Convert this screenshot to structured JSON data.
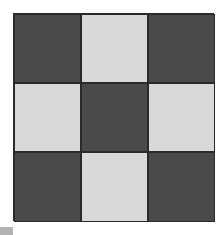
{
  "board": {
    "rows": 3,
    "cols": 3,
    "colors": {
      "dark": "#4a4a4a",
      "light": "#d9d9d9"
    },
    "pattern": [
      [
        "dark",
        "light",
        "dark"
      ],
      [
        "light",
        "dark",
        "light"
      ],
      [
        "dark",
        "light",
        "dark"
      ]
    ]
  },
  "swatch": {
    "color": "#b3b3b3"
  }
}
